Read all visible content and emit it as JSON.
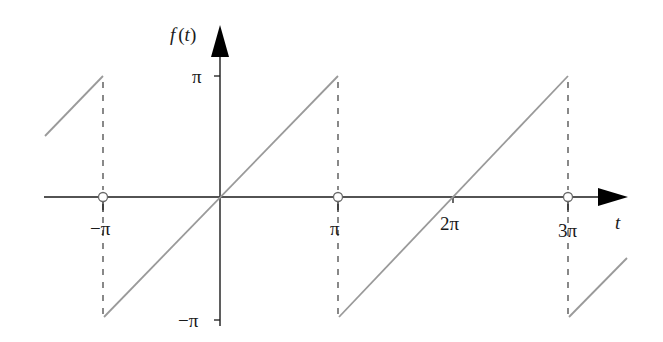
{
  "figure": {
    "kind": "sawtooth-wave-diagram",
    "y_axis_label": "f(t)",
    "x_axis_label": "t",
    "x_ticks": [
      {
        "label": "−π",
        "value": "-pi"
      },
      {
        "label": "π",
        "value": "pi"
      },
      {
        "label": "2π",
        "value": "2pi"
      },
      {
        "label": "3π",
        "value": "3pi"
      }
    ],
    "y_ticks": [
      {
        "label": "π",
        "value": "pi"
      },
      {
        "label": "−π",
        "value": "-pi"
      }
    ],
    "colors": {
      "axis": "#1a1a1a",
      "signal": "#9a9a9a",
      "dashed": "#4a4a4a",
      "open_circle_fill": "#ffffff"
    }
  },
  "labels": {
    "f_of_t": "f(t)",
    "f": "f",
    "paren_open": "(",
    "t_inner": "t",
    "paren_close": ")",
    "t": "t",
    "y_pi": "π",
    "y_neg_pi": "−π",
    "x_neg_pi": "−π",
    "x_pi": "π",
    "x_2pi": "2π",
    "x_3pi": "3π"
  }
}
